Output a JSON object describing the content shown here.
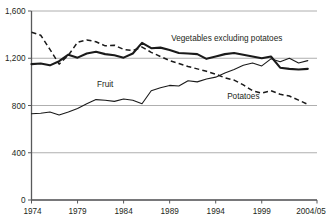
{
  "chart_data": {
    "type": "line",
    "title": "",
    "subtitle": "",
    "xlabel": "",
    "ylabel": "",
    "xlim": [
      1974,
      2005
    ],
    "ylim": [
      0,
      1600
    ],
    "grid": true,
    "gridlines_y": [
      0,
      400,
      800,
      1200,
      1600
    ],
    "legend_position": "inline-annotations",
    "x": [
      1974,
      1975,
      1976,
      1977,
      1978,
      1979,
      1980,
      1981,
      1982,
      1983,
      1984,
      1985,
      1986,
      1987,
      1988,
      1989,
      1990,
      1991,
      1992,
      1993,
      1994,
      1995,
      1996,
      1997,
      1998,
      1999,
      2000,
      2001,
      2002,
      2003,
      2004
    ],
    "x_tick_labels": [
      "1974",
      "1979",
      "1984",
      "1989",
      "1994",
      "1999",
      "2004/05"
    ],
    "x_tick_values": [
      1974,
      1979,
      1984,
      1989,
      1994,
      1999,
      2004
    ],
    "y_tick_labels": [
      "0",
      "400",
      "800",
      "1,200",
      "1,600"
    ],
    "y_tick_values": [
      0,
      400,
      800,
      1200,
      1600
    ],
    "series": [
      {
        "name": "Vegetables excluding potatoes",
        "style": "solid-thick",
        "label_x": 1995.2,
        "label_y": 1345,
        "values": [
          1150,
          1155,
          1140,
          1175,
          1230,
          1205,
          1240,
          1255,
          1235,
          1225,
          1205,
          1240,
          1330,
          1285,
          1290,
          1270,
          1245,
          1240,
          1235,
          1195,
          1215,
          1235,
          1245,
          1230,
          1215,
          1200,
          1215,
          1120,
          1110,
          1105,
          1110
        ]
      },
      {
        "name": "Fruit",
        "style": "solid-thin",
        "label_x": 1982.0,
        "label_y": 955,
        "values": [
          730,
          735,
          745,
          720,
          745,
          775,
          815,
          850,
          845,
          835,
          855,
          845,
          815,
          925,
          950,
          970,
          965,
          1010,
          1000,
          1025,
          1040,
          1075,
          1105,
          1140,
          1160,
          1135,
          1195,
          1170,
          1200,
          1160,
          1180
        ]
      },
      {
        "name": "Potatoes",
        "style": "dashed",
        "label_x": 1997.0,
        "label_y": 855,
        "values": [
          1420,
          1395,
          1275,
          1150,
          1225,
          1335,
          1355,
          1340,
          1305,
          1310,
          1275,
          1265,
          1295,
          1250,
          1215,
          1180,
          1155,
          1130,
          1110,
          1090,
          1065,
          1035,
          1015,
          975,
          925,
          905,
          925,
          895,
          880,
          845,
          810
        ]
      }
    ]
  },
  "annotations": {
    "vegetables_label": "Vegetables excluding potatoes",
    "fruit_label": "Fruit",
    "potatoes_label": "Potatoes"
  }
}
